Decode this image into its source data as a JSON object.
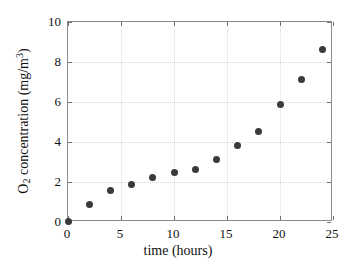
{
  "chart_data": {
    "type": "scatter",
    "title": "",
    "xlabel": "time (hours)",
    "ylabel": "O2 concentration (mg/m3)",
    "ylabel_parts": {
      "prefix": "O",
      "sub": "2",
      "middle": " concentration (mg/m",
      "sup": "3",
      "suffix": ")"
    },
    "xlim": [
      0,
      25
    ],
    "ylim": [
      0,
      10
    ],
    "xticks": [
      0,
      5,
      10,
      15,
      20,
      25
    ],
    "yticks": [
      0,
      2,
      4,
      6,
      8,
      10
    ],
    "xticklabels": [
      "0",
      "5",
      "10",
      "15",
      "20",
      "25"
    ],
    "yticklabels": [
      "0",
      "2",
      "4",
      "6",
      "8",
      "10"
    ],
    "grid": true,
    "grid_style": "dotted",
    "legend": "none",
    "marker_color": "#3a3a3a",
    "marker_size": 7,
    "axis_color": "#8a8a8a",
    "grid_color": "#d9d9d9",
    "background": "#ffffff",
    "x": [
      0,
      2,
      4,
      6,
      8,
      10,
      12,
      14,
      16,
      18,
      20,
      22,
      24
    ],
    "y": [
      0.05,
      0.9,
      1.6,
      1.9,
      2.25,
      2.5,
      2.65,
      3.15,
      3.85,
      4.55,
      5.9,
      7.15,
      8.65
    ],
    "points": [
      {
        "x": 0,
        "y": 0.05
      },
      {
        "x": 2,
        "y": 0.9
      },
      {
        "x": 4,
        "y": 1.6
      },
      {
        "x": 6,
        "y": 1.9
      },
      {
        "x": 8,
        "y": 2.25
      },
      {
        "x": 10,
        "y": 2.5
      },
      {
        "x": 12,
        "y": 2.65
      },
      {
        "x": 14,
        "y": 3.15
      },
      {
        "x": 16,
        "y": 3.85
      },
      {
        "x": 18,
        "y": 4.55
      },
      {
        "x": 20,
        "y": 5.9
      },
      {
        "x": 22,
        "y": 7.15
      },
      {
        "x": 24,
        "y": 8.65
      }
    ]
  }
}
